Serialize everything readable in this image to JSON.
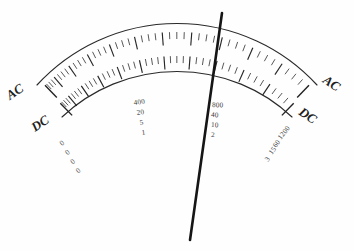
{
  "figure": {
    "background_color": "#fefefe",
    "ink_color": "#2a2a2a",
    "needle_color": "#151515"
  },
  "bands": {
    "outer": {
      "name": "AC",
      "left_label": "AC",
      "right_label": "AC"
    },
    "inner": {
      "name": "DC",
      "left_label": "DC",
      "right_label": "DC"
    }
  },
  "origin_zeros": {
    "label": "0",
    "count": 4,
    "values": [
      "0",
      "0",
      "0",
      "0"
    ]
  },
  "scale_labels": {
    "mid_left": {
      "position_note": "left of centre",
      "values": [
        "400",
        "20",
        "5",
        "1"
      ]
    },
    "mid_right": {
      "position_note": "right of centre at needle",
      "values": [
        "800",
        "40",
        "10",
        "2"
      ]
    },
    "right_end": {
      "position_note": "right end, rotated along arc",
      "values": [
        "1200",
        "60",
        "15",
        "3"
      ]
    }
  },
  "needle": {
    "name": "pointer-needle",
    "top_x": 222,
    "top_y": 13,
    "bottom_x": 190,
    "bottom_y": 240
  },
  "chart_data": {
    "type": "line",
    "xlabel": "",
    "ylabel": "",
    "series": [
      {
        "name": "AC arc (outer)",
        "values": [
          "0",
          "400",
          "800",
          "1200"
        ]
      },
      {
        "name": "DC arc (inner) range 60",
        "values": [
          "0",
          "20",
          "40",
          "60"
        ]
      },
      {
        "name": "DC arc (inner) range 15",
        "values": [
          "0",
          "5",
          "10",
          "15"
        ]
      },
      {
        "name": "DC arc (inner) range 3",
        "values": [
          "0",
          "1",
          "2",
          "3"
        ]
      }
    ],
    "categories": [
      "0",
      "1/3",
      "2/3",
      "full"
    ],
    "legend": [
      "AC",
      "DC"
    ],
    "grid": false
  }
}
